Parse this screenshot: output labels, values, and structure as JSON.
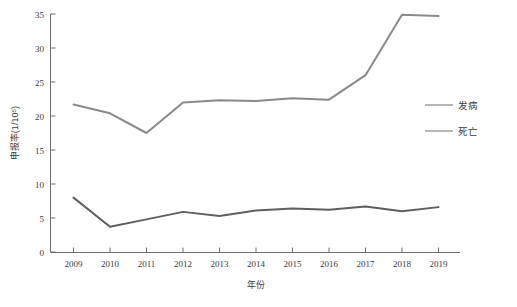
{
  "chart_data": {
    "type": "line",
    "title": "",
    "xlabel": "年份",
    "ylabel": "申报率(1/10⁵)",
    "x": [
      2009,
      2010,
      2011,
      2012,
      2013,
      2014,
      2015,
      2016,
      2017,
      2018,
      2019
    ],
    "categories": [
      "2009",
      "2010",
      "2011",
      "2012",
      "2013",
      "2014",
      "2015",
      "2016",
      "2017",
      "2018",
      "2019"
    ],
    "xlim": [
      2009,
      2019
    ],
    "ylim": [
      0,
      35
    ],
    "yticks": [
      0,
      5,
      10,
      15,
      20,
      25,
      30,
      35
    ],
    "ytick_labels": [
      "0",
      "5",
      "10",
      "15",
      "20",
      "25",
      "30",
      "35"
    ],
    "grid": false,
    "legend_position": "right",
    "series": [
      {
        "name": "发病",
        "color": "#8a8a8a",
        "values": [
          21.7,
          20.4,
          17.5,
          22.0,
          22.3,
          22.2,
          22.6,
          22.4,
          26.0,
          34.9,
          34.7
        ]
      },
      {
        "name": "死亡",
        "color": "#5f5f5f",
        "values": [
          8.0,
          3.7,
          4.8,
          5.9,
          5.3,
          6.1,
          6.4,
          6.2,
          6.7,
          6.0,
          6.6
        ]
      }
    ]
  },
  "axes": {
    "x_title": "年份",
    "y_title": "申报率(1/10⁵)"
  },
  "legend": {
    "items": [
      {
        "label": "发病",
        "color": "#8a8a8a"
      },
      {
        "label": "死亡",
        "color": "#5f5f5f"
      }
    ]
  }
}
